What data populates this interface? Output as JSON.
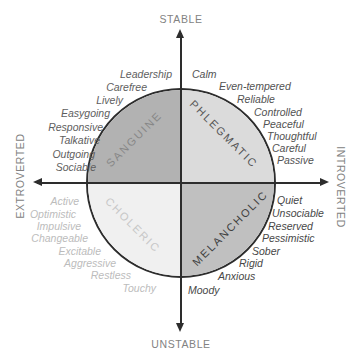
{
  "diagram": {
    "type": "personality-temperament-quadrant-diagram",
    "axis_line_color": "#2d2d2d",
    "axis_label_color": "#828282",
    "axes": {
      "top": "STABLE",
      "bottom": "UNSTABLE",
      "left": "EXTROVERTED",
      "right": "INTROVERTED"
    },
    "quadrants": [
      {
        "name": "SANGUINE",
        "position": "top-left",
        "fill": "#b2b2b2",
        "label_color": "#878787",
        "trait_color": "#5e5e5e",
        "traits": [
          "Leadership",
          "Carefree",
          "Lively",
          "Easygoing",
          "Responsive",
          "Talkative",
          "Outgoing",
          "Sociable"
        ]
      },
      {
        "name": "PHLEGMATIC",
        "position": "top-right",
        "fill": "#dbdbdb",
        "label_color": "#565656",
        "trait_color": "#525252",
        "traits": [
          "Calm",
          "Even-tempered",
          "Reliable",
          "Controlled",
          "Peaceful",
          "Thoughtful",
          "Careful",
          "Passive"
        ]
      },
      {
        "name": "CHOLERIC",
        "position": "bottom-left",
        "fill": "#f0f0f0",
        "label_color": "#c7c7c7",
        "trait_color": "#bcbcbc",
        "traits": [
          "Active",
          "Optimistic",
          "Impulsive",
          "Changeable",
          "Excitable",
          "Aggressive",
          "Restless",
          "Touchy"
        ]
      },
      {
        "name": "MELANCHOLIC",
        "position": "bottom-right",
        "fill": "#c0c0c0",
        "label_color": "#404040",
        "trait_color": "#474747",
        "traits": [
          "Quiet",
          "Unsociable",
          "Reserved",
          "Pessimistic",
          "Sober",
          "Rigid",
          "Anxious",
          "Moody"
        ]
      }
    ]
  }
}
